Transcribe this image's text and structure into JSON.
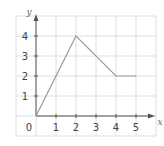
{
  "chart_data": {
    "type": "line",
    "title": "",
    "xlabel": "x",
    "ylabel": "y",
    "x": [
      0,
      2,
      4,
      5
    ],
    "series": [
      {
        "name": "y",
        "values": [
          0,
          4,
          2,
          2
        ]
      }
    ],
    "xlim": [
      0,
      5
    ],
    "ylim": [
      0,
      4
    ],
    "x_ticks": [
      "1",
      "2",
      "3",
      "4",
      "5"
    ],
    "y_ticks": [
      "1",
      "2",
      "3",
      "4"
    ],
    "origin_label": "0",
    "grid": true,
    "legend": null
  },
  "colors": {
    "line": "#9a9a9a",
    "axis": "#555555",
    "grid": "#dedede",
    "text": "#444444"
  }
}
